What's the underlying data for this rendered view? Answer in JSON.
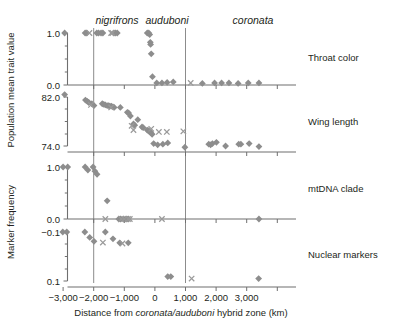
{
  "figure": {
    "taxa": [
      {
        "name": "nigrifrons",
        "x": 117
      },
      {
        "name": "auduboni",
        "x": 167
      },
      {
        "name": "coronata",
        "x": 253
      }
    ],
    "y_axis_titles": {
      "upper": "Population mean trait value",
      "lower": "Marker frequency"
    },
    "x_axis_title": "Distance from coronata/auduboni hybrid zone (km)",
    "x_axis_title_parts": {
      "pre": "Distance from ",
      "italic": "coronata/auduboni",
      "post": " hybrid zone (km)"
    },
    "x_ticks": [
      "−3,000",
      "−2,000",
      "−1,000",
      "0",
      "1,000",
      "2,000",
      "3,000"
    ],
    "x_tick_values": [
      -3000,
      -2000,
      -1000,
      0,
      1000,
      2000,
      3000
    ],
    "panel_labels": [
      "Throat color",
      "Wing length",
      "mtDNA clade",
      "Nuclear markers"
    ],
    "colors": {
      "marker": "#8d8d8d",
      "cross": "#9a9a9a",
      "axis": "#6f6f6f",
      "vline": "#8c8c8c",
      "text": "#231f20",
      "background": "#ffffff"
    },
    "reference_lines_km": [
      -2300,
      0
    ]
  },
  "chart_data": [
    {
      "type": "scatter",
      "title": "Throat color",
      "xlabel": "Distance from coronata/auduboni hybrid zone (km)",
      "ylabel": "Population mean trait value",
      "xlim": [
        -3600,
        3600
      ],
      "ylim": [
        -0.12,
        1.12
      ],
      "yticks": [
        0.0,
        1.0
      ],
      "ytick_labels": [
        "0.0",
        "1.0"
      ],
      "grid": false,
      "legend": "none",
      "series": [
        {
          "name": "diamond",
          "marker": "diamond",
          "points": [
            [
              -2950,
              1.0
            ],
            [
              -2280,
              1.0
            ],
            [
              -2230,
              1.0
            ],
            [
              -1900,
              1.0
            ],
            [
              -1840,
              1.0
            ],
            [
              -1760,
              1.0
            ],
            [
              -1700,
              1.0
            ],
            [
              -1340,
              1.0
            ],
            [
              -1290,
              1.0
            ],
            [
              -1230,
              1.0
            ],
            [
              -250,
              1.0
            ],
            [
              -200,
              1.0
            ],
            [
              -170,
              0.97
            ],
            [
              -150,
              0.82
            ],
            [
              -140,
              0.78
            ],
            [
              -120,
              0.6
            ],
            [
              -80,
              0.16
            ],
            [
              60,
              0.04
            ],
            [
              230,
              0.04
            ],
            [
              400,
              0.05
            ],
            [
              600,
              0.06
            ],
            [
              1550,
              0.03
            ],
            [
              1950,
              0.04
            ],
            [
              2180,
              0.04
            ],
            [
              2420,
              0.04
            ],
            [
              2720,
              0.03
            ],
            [
              3050,
              0.04
            ],
            [
              3400,
              0.04
            ]
          ]
        },
        {
          "name": "cross",
          "marker": "x",
          "points": [
            [
              -2140,
              1.0
            ],
            [
              -1430,
              1.0
            ],
            [
              -1390,
              1.0
            ],
            [
              1170,
              0.04
            ]
          ]
        }
      ]
    },
    {
      "type": "scatter",
      "title": "Wing length",
      "xlabel": "Distance from coronata/auduboni hybrid zone (km)",
      "ylabel": "Population mean trait value",
      "xlim": [
        -3600,
        3600
      ],
      "ylim": [
        72.6,
        83.4
      ],
      "yticks": [
        74.0,
        82.0
      ],
      "ytick_labels": [
        "74.0",
        "82.0"
      ],
      "grid": false,
      "legend": "none",
      "series": [
        {
          "name": "diamond",
          "marker": "diamond",
          "points": [
            [
              -2950,
              82.4
            ],
            [
              -2270,
              81.5
            ],
            [
              -2210,
              81.3
            ],
            [
              -2160,
              81.1
            ],
            [
              -2060,
              80.9
            ],
            [
              -1990,
              80.6
            ],
            [
              -1720,
              80.9
            ],
            [
              -1670,
              80.8
            ],
            [
              -1620,
              80.7
            ],
            [
              -1560,
              80.6
            ],
            [
              -1510,
              80.6
            ],
            [
              -1470,
              80.5
            ],
            [
              -1420,
              80.5
            ],
            [
              -1370,
              80.4
            ],
            [
              -1330,
              80.3
            ],
            [
              -1130,
              80.3
            ],
            [
              -900,
              79.5
            ],
            [
              -860,
              79.4
            ],
            [
              -800,
              78.9
            ],
            [
              -700,
              77.6
            ],
            [
              -660,
              77.4
            ],
            [
              -560,
              78.3
            ],
            [
              -420,
              77.1
            ],
            [
              -380,
              77.0
            ],
            [
              -250,
              76.6
            ],
            [
              -210,
              76.5
            ],
            [
              -190,
              76.4
            ],
            [
              -160,
              76.3
            ],
            [
              -120,
              76.1
            ],
            [
              -90,
              75.9
            ],
            [
              -40,
              74.4
            ],
            [
              90,
              74.2
            ],
            [
              260,
              74.3
            ],
            [
              420,
              74.5
            ],
            [
              980,
              73.8
            ],
            [
              1760,
              74.3
            ],
            [
              1820,
              74.2
            ],
            [
              1880,
              74.4
            ],
            [
              2010,
              74.6
            ],
            [
              2310,
              74.0
            ],
            [
              2740,
              74.3
            ],
            [
              2810,
              74.3
            ],
            [
              3080,
              74.4
            ],
            [
              3400,
              73.9
            ]
          ]
        },
        {
          "name": "cross",
          "marker": "x",
          "points": [
            [
              -2090,
              80.7
            ],
            [
              -1430,
              80.3
            ],
            [
              -760,
              77.3
            ],
            [
              -700,
              76.6
            ],
            [
              -120,
              76.8
            ],
            [
              130,
              76.3
            ],
            [
              390,
              76.3
            ],
            [
              930,
              76.4
            ]
          ]
        }
      ]
    },
    {
      "type": "scatter",
      "title": "mtDNA clade",
      "xlabel": "Distance from coronata/auduboni hybrid zone (km)",
      "ylabel": "Marker frequency",
      "xlim": [
        -3600,
        3600
      ],
      "ylim": [
        -0.1,
        1.1
      ],
      "yticks": [
        0.0,
        1.0
      ],
      "ytick_labels": [
        "0.0",
        "1.0"
      ],
      "grid": false,
      "legend": "none",
      "series": [
        {
          "name": "diamond",
          "marker": "diamond",
          "points": [
            [
              -3000,
              1.0
            ],
            [
              -2850,
              1.0
            ],
            [
              -2280,
              1.0
            ],
            [
              -2190,
              0.94
            ],
            [
              -2020,
              1.0
            ],
            [
              -1960,
              0.92
            ],
            [
              -1890,
              0.86
            ],
            [
              -1560,
              0.35
            ],
            [
              -1180,
              0.0
            ],
            [
              -1120,
              0.0
            ],
            [
              -1020,
              0.0
            ],
            [
              -940,
              0.0
            ],
            [
              -870,
              0.0
            ],
            [
              3400,
              0.0
            ]
          ]
        },
        {
          "name": "cross",
          "marker": "x",
          "points": [
            [
              -1620,
              0.0
            ],
            [
              -1100,
              0.0
            ],
            [
              -1000,
              0.0
            ],
            [
              -880,
              0.0
            ],
            [
              -820,
              0.0
            ],
            [
              230,
              0.0
            ]
          ]
        }
      ]
    },
    {
      "type": "scatter",
      "title": "Nuclear markers",
      "xlabel": "Distance from coronata/auduboni hybrid zone (km)",
      "ylabel": "Marker frequency",
      "xlim": [
        -3600,
        3600
      ],
      "ylim": [
        -0.13,
        0.12
      ],
      "yticks": [
        -0.1,
        0.1
      ],
      "ytick_labels": [
        "−0.1",
        "0.1"
      ],
      "grid": false,
      "legend": "none",
      "series": [
        {
          "name": "diamond",
          "marker": "diamond",
          "points": [
            [
              -3010,
              -0.1
            ],
            [
              -2880,
              -0.1
            ],
            [
              -2290,
              -0.1
            ],
            [
              -2130,
              -0.078
            ],
            [
              -1990,
              -0.062
            ],
            [
              -1620,
              -0.1
            ],
            [
              -1370,
              -0.072
            ],
            [
              -1150,
              -0.056
            ],
            [
              -870,
              -0.056
            ],
            [
              420,
              0.082
            ],
            [
              520,
              0.082
            ],
            [
              3390,
              0.09
            ]
          ]
        },
        {
          "name": "cross",
          "marker": "x",
          "points": [
            [
              -1700,
              -0.057
            ],
            [
              -1060,
              -0.053
            ],
            [
              1200,
              0.09
            ]
          ]
        }
      ]
    }
  ]
}
